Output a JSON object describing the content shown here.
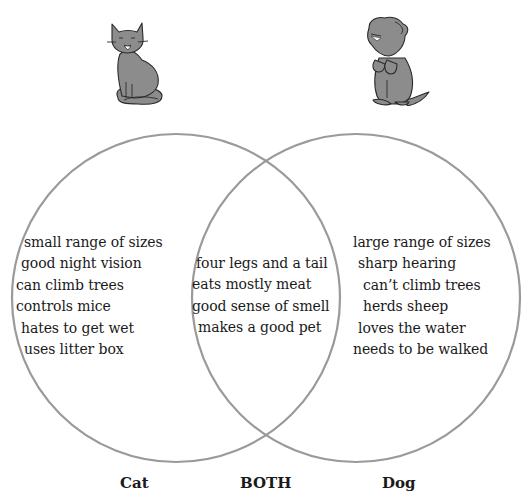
{
  "diagram": {
    "type": "venn",
    "stroke_color": "#9a9a9a",
    "animals": {
      "left": {
        "name": "Cat",
        "icon": "cat-icon"
      },
      "right": {
        "name": "Dog",
        "icon": "dog-icon"
      }
    },
    "labels": {
      "left": "Cat",
      "center": "BOTH",
      "right": "Dog"
    },
    "left_items": [
      "small range of sizes",
      "good night vision",
      "can climb trees",
      "controls mice",
      "hates to get wet",
      "uses litter box"
    ],
    "center_items": [
      "four legs and a tail",
      "eats mostly meat",
      "good sense of smell",
      "makes a good pet"
    ],
    "right_items": [
      "large range of sizes",
      "sharp hearing",
      "can’t climb trees",
      "herds sheep",
      "loves the water",
      "needs to be walked"
    ]
  }
}
